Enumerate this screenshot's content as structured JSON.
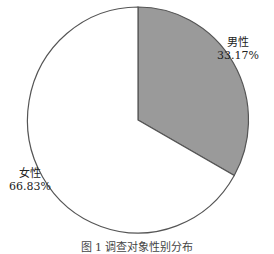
{
  "chart_data": {
    "type": "pie",
    "title": "",
    "caption": "图 1 调查对象性别分布",
    "categories": [
      "男性",
      "女性"
    ],
    "values": [
      33.17,
      66.83
    ],
    "labels": [
      "男性\n33.17%",
      "女性\n66.83%"
    ],
    "colors": [
      "#9a9a9a",
      "#ffffff"
    ],
    "start_angle_deg": 90,
    "direction": "clockwise",
    "legend": "none"
  },
  "labels": {
    "male": {
      "name": "男性",
      "pct": "33.17%"
    },
    "female": {
      "name": "女性",
      "pct": "66.83%"
    }
  }
}
